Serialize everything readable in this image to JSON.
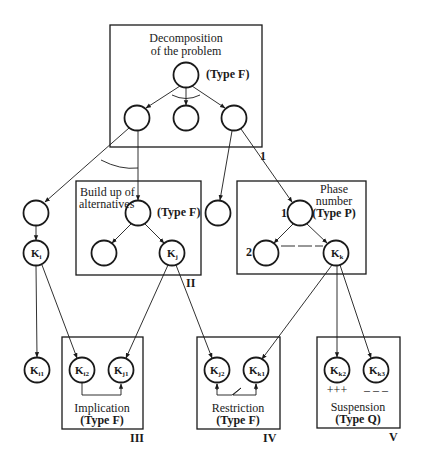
{
  "diagram": {
    "boxes": {
      "decomposition": {
        "title_line1": "Decomposition",
        "title_line2": "of the problem",
        "type": "(Type F)",
        "edge_label": "1"
      },
      "alternatives": {
        "title_line1": "Build up of",
        "title_line2": "alternatives",
        "type": "(Type F)",
        "roman": "II"
      },
      "phase": {
        "title_line1": "Phase",
        "title_line2": "number",
        "type": "(Type P)",
        "node1_label": "1",
        "node2_label": "2"
      },
      "implication": {
        "title": "Implication",
        "type": "(Type F)",
        "roman": "III"
      },
      "restriction": {
        "title": "Restriction",
        "type": "(Type F)",
        "roman": "IV"
      },
      "suspension": {
        "title": "Suspension",
        "type": "(Type Q)",
        "roman": "V",
        "plus": "+++",
        "minus": "– – –"
      }
    },
    "nodes": {
      "ki": {
        "base": "K",
        "sub": "i"
      },
      "kj": {
        "base": "K",
        "sub": "j"
      },
      "kk": {
        "base": "K",
        "sub": "k"
      },
      "ki1": {
        "base": "K",
        "sub": "i1"
      },
      "ki2": {
        "base": "K",
        "sub": "i2"
      },
      "kj1": {
        "base": "K",
        "sub": "j1"
      },
      "kj2": {
        "base": "K",
        "sub": "j2"
      },
      "kk1": {
        "base": "K",
        "sub": "k1"
      },
      "kk2": {
        "base": "K",
        "sub": "k2"
      },
      "kk3": {
        "base": "K",
        "sub": "k3"
      }
    }
  }
}
